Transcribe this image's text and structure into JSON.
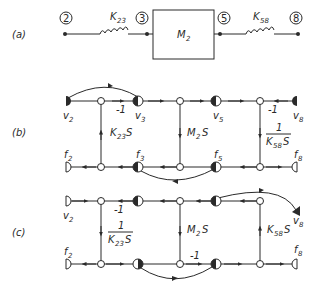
{
  "parts": {
    "a": "(a)",
    "b": "(b)",
    "c": "(c)"
  },
  "schematic": {
    "nodes": [
      "2",
      "3",
      "5",
      "8"
    ],
    "spring1": {
      "main": "K",
      "sub": "23"
    },
    "mass": {
      "main": "M",
      "sub": "2"
    },
    "spring2": {
      "main": "K",
      "sub": "58"
    }
  },
  "graph_b": {
    "v2": {
      "main": "v",
      "sub": "2"
    },
    "v3": {
      "main": "v",
      "sub": "3"
    },
    "v5": {
      "main": "v",
      "sub": "5"
    },
    "v8": {
      "main": "v",
      "sub": "8"
    },
    "f2": {
      "main": "f",
      "sub": "2"
    },
    "f3": {
      "main": "f",
      "sub": "3"
    },
    "f5": {
      "main": "f",
      "sub": "5"
    },
    "f8": {
      "main": "f",
      "sub": "8"
    },
    "gain_left": "-1",
    "gain_right": "-1",
    "k23s": {
      "main": "K",
      "sub": "23",
      "tail": "S"
    },
    "m2s": {
      "main": "M",
      "sub": "2",
      "tail": "S"
    },
    "inv_k58s": {
      "num": "1",
      "main": "K",
      "sub": "58",
      "tail": "S"
    }
  },
  "graph_c": {
    "v2": {
      "main": "v",
      "sub": "2"
    },
    "v8": {
      "main": "v",
      "sub": "8"
    },
    "f2": {
      "main": "f",
      "sub": "2"
    },
    "f8": {
      "main": "f",
      "sub": "8"
    },
    "gain_top": "-1",
    "gain_bottom": "-1",
    "inv_k23s": {
      "num": "1",
      "main": "K",
      "sub": "23",
      "tail": "S"
    },
    "m2s": {
      "main": "M",
      "sub": "2",
      "tail": "S"
    },
    "k58s": {
      "main": "K",
      "sub": "58",
      "tail": "S"
    }
  }
}
